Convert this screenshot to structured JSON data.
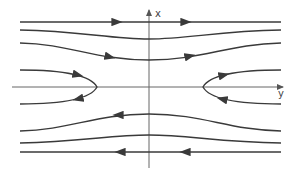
{
  "diagram": {
    "type": "phase-portrait-streamlines",
    "axes": {
      "vertical_label": "x",
      "horizontal_label": "y"
    },
    "colors": {
      "stroke": "#3a3a3a",
      "axis": "#555555",
      "background": "#ffffff"
    },
    "streamlines": [
      {
        "id": "top-1",
        "direction": "right",
        "shape": "straight"
      },
      {
        "id": "top-2",
        "direction": "right",
        "shape": "dip"
      },
      {
        "id": "top-3",
        "direction": "right",
        "shape": "dip"
      },
      {
        "id": "left-parabola",
        "direction": "inward-then-outward",
        "shape": "parabola-opening-left"
      },
      {
        "id": "right-parabola",
        "direction": "inward-then-outward",
        "shape": "parabola-opening-right"
      },
      {
        "id": "bottom-3",
        "direction": "left",
        "shape": "bump"
      },
      {
        "id": "bottom-2",
        "direction": "left",
        "shape": "bump"
      },
      {
        "id": "bottom-1",
        "direction": "left",
        "shape": "straight"
      }
    ]
  }
}
